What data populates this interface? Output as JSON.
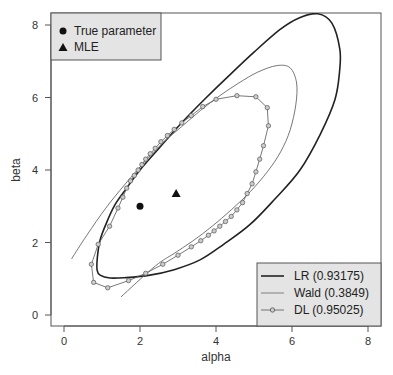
{
  "chart_data": {
    "type": "line",
    "title": "",
    "xlabel": "alpha",
    "ylabel": "beta",
    "xlim": [
      -0.3,
      8.3
    ],
    "ylim": [
      -0.3,
      8.35
    ],
    "xticks": [
      0,
      2,
      4,
      6,
      8
    ],
    "yticks": [
      0,
      2,
      4,
      6,
      8
    ],
    "xtick_labels": [
      "0",
      "2",
      "4",
      "6",
      "8"
    ],
    "ytick_labels": [
      "0",
      "2",
      "4",
      "6",
      "8"
    ],
    "grid": false,
    "points": [
      {
        "name": "True parameter",
        "marker": "circle",
        "x": 2.0,
        "y": 3.0
      },
      {
        "name": "MLE",
        "marker": "triangle",
        "x": 2.95,
        "y": 3.35
      }
    ],
    "series": [
      {
        "name": "LR (0.93175)",
        "style": "thick",
        "closed": true,
        "x": [
          6.68,
          7.05,
          7.26,
          7.25,
          7.13,
          6.75,
          6.21,
          5.55,
          4.89,
          4.2,
          3.58,
          2.9,
          2.26,
          1.6,
          1.21,
          0.95,
          0.87,
          0.88,
          0.95,
          1.12,
          1.34,
          1.65,
          2.0,
          2.5,
          3.05,
          3.7,
          4.37,
          5.0,
          5.68,
          6.2,
          6.68
        ],
        "y": [
          8.31,
          8.05,
          7.32,
          6.7,
          5.94,
          5.0,
          4.0,
          3.2,
          2.49,
          1.95,
          1.52,
          1.25,
          1.1,
          1.03,
          1.02,
          1.1,
          1.24,
          1.6,
          2.07,
          2.55,
          3.04,
          3.5,
          4.0,
          4.6,
          5.25,
          5.95,
          6.63,
          7.25,
          7.87,
          8.2,
          8.31
        ]
      },
      {
        "name": "Wald (0.3849)",
        "style": "thin",
        "closed": false,
        "x": [
          0.2,
          0.6,
          1.1,
          1.6,
          2.1,
          2.6,
          3.1,
          3.6,
          4.1,
          4.6,
          5.1,
          5.6,
          5.95,
          6.12,
          6.1,
          5.95,
          5.7,
          5.35,
          4.9,
          4.4,
          3.9,
          3.4,
          2.9,
          2.4,
          1.5
        ],
        "y": [
          1.55,
          2.2,
          2.95,
          3.6,
          4.2,
          4.75,
          5.2,
          5.65,
          6.05,
          6.4,
          6.7,
          6.88,
          6.82,
          6.4,
          5.8,
          5.1,
          4.5,
          3.95,
          3.4,
          2.9,
          2.45,
          2.05,
          1.7,
          1.35,
          0.5
        ]
      },
      {
        "name": "DL (0.95025)",
        "style": "thin-circles",
        "closed": true,
        "x": [
          4.55,
          5.05,
          5.35,
          5.38,
          5.25,
          5.15,
          5.05,
          4.95,
          4.82,
          4.7,
          4.55,
          4.4,
          4.25,
          4.1,
          3.95,
          3.8,
          3.6,
          3.35,
          3.0,
          2.6,
          2.15,
          1.7,
          1.15,
          0.78,
          0.72,
          0.9,
          1.2,
          1.42,
          1.55,
          1.65,
          1.75,
          1.85,
          1.95,
          2.05,
          2.15,
          2.27,
          2.4,
          2.55,
          2.72,
          2.9,
          3.1,
          3.35,
          3.65,
          4.0,
          4.55
        ],
        "y": [
          6.05,
          6.02,
          5.72,
          5.22,
          4.67,
          4.3,
          3.95,
          3.62,
          3.35,
          3.1,
          2.9,
          2.72,
          2.58,
          2.45,
          2.32,
          2.2,
          2.05,
          1.88,
          1.65,
          1.4,
          1.15,
          0.95,
          0.75,
          0.9,
          1.4,
          1.95,
          2.45,
          2.95,
          3.25,
          3.5,
          3.7,
          3.85,
          4.0,
          4.15,
          4.3,
          4.45,
          4.6,
          4.78,
          4.95,
          5.12,
          5.3,
          5.5,
          5.75,
          5.95,
          6.05
        ]
      }
    ],
    "legends": [
      {
        "placement": "top-left",
        "entries": [
          "True parameter",
          "MLE"
        ]
      },
      {
        "placement": "bottom-right",
        "entries": [
          "LR (0.93175)",
          "Wald (0.3849)",
          "DL (0.95025)"
        ]
      }
    ]
  }
}
